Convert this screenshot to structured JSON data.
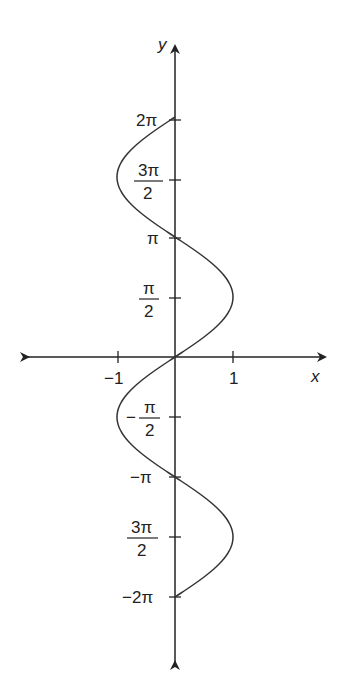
{
  "chart_data": {
    "type": "line",
    "title": "",
    "xlabel": "x",
    "ylabel": "y",
    "xlim": [
      -1.5,
      1.5
    ],
    "ylim": [
      -2.5,
      2.5
    ],
    "x_ticks": [
      {
        "value": -1,
        "label": "−1"
      },
      {
        "value": 1,
        "label": "1"
      }
    ],
    "y_ticks": [
      {
        "value": 6.2832,
        "label": "2π"
      },
      {
        "value": 4.7124,
        "label": "3π/2",
        "num": "3π",
        "den": "2"
      },
      {
        "value": 3.1416,
        "label": "π"
      },
      {
        "value": 1.5708,
        "label": "π/2",
        "num": "π",
        "den": "2"
      },
      {
        "value": -1.5708,
        "label": "−π/2",
        "num": "π",
        "den": "2",
        "neg": true
      },
      {
        "value": -3.1416,
        "label": "−π"
      },
      {
        "value": -4.7124,
        "label": "3π/2",
        "num": "3π",
        "den": "2"
      },
      {
        "value": -6.2832,
        "label": "−2π"
      }
    ],
    "series": [
      {
        "name": "x = sin(y)",
        "y_range": [
          -6.2832,
          6.2832
        ],
        "points": [
          [
            0,
            -6.2832
          ],
          [
            1,
            -4.7124
          ],
          [
            0,
            -3.1416
          ],
          [
            -1,
            -1.5708
          ],
          [
            0,
            0
          ],
          [
            1,
            1.5708
          ],
          [
            0,
            3.1416
          ],
          [
            -1,
            4.7124
          ],
          [
            0,
            6.2832
          ]
        ]
      }
    ],
    "grid": false,
    "legend": false
  },
  "axes": {
    "x_label": "x",
    "y_label": "y"
  },
  "labels": {
    "two_pi": "2π",
    "pi": "π",
    "neg_pi": "−π",
    "neg_two_pi": "−2π",
    "three_pi": "3π",
    "two": "2",
    "pi_frac": "π",
    "minus": "−",
    "x_neg1": "−1",
    "x_pos1": "1"
  }
}
